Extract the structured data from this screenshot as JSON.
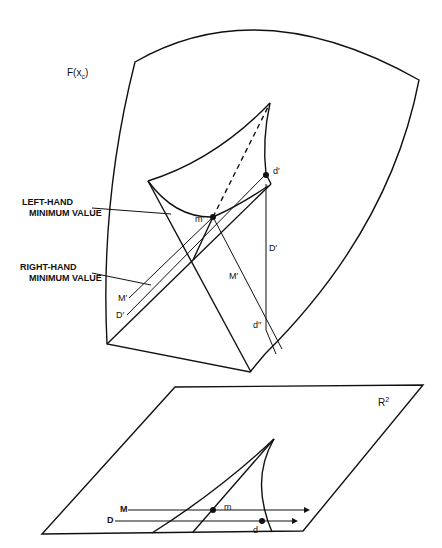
{
  "figure": {
    "surface_label": "F(x",
    "surface_label_sub": "c",
    "surface_label_close": ")",
    "plane_label": "R",
    "plane_label_sup": "2",
    "annotations": {
      "left_hand_line1": "LEFT-HAND",
      "left_hand_line2": "MINIMUM VALUE",
      "right_hand_line1": "RIGHT-HAND",
      "right_hand_line2": "MINIMUM VALUE"
    },
    "surface_points": {
      "m_prime": "m′",
      "d_prime": "d′",
      "d_double_prime": "d′′"
    },
    "surface_lines": {
      "M_prime_left": "M′",
      "D_prime_left": "D′",
      "M_prime_mid": "M′",
      "D_prime_vertical": "D′"
    },
    "plane_lines": {
      "M": "M",
      "D": "D"
    },
    "plane_points": {
      "m": "m",
      "d": "d"
    }
  }
}
